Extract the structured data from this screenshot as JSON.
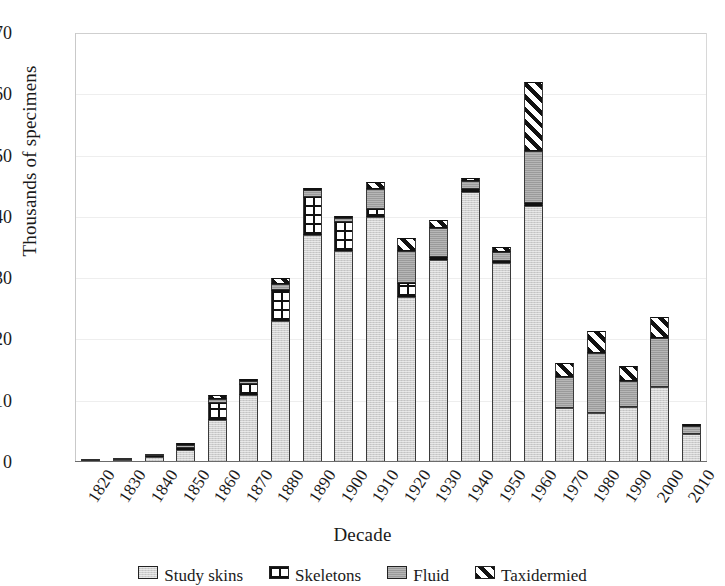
{
  "chart_data": {
    "type": "bar",
    "title": "",
    "subtitle": "",
    "xlabel": "Decade",
    "ylabel": "Thousands of specimens",
    "ylim": [
      0,
      70
    ],
    "yticks": [
      0,
      10,
      20,
      30,
      40,
      50,
      60,
      70
    ],
    "grid": false,
    "stacked": true,
    "legend_position": "bottom",
    "legend_note": "legend row is cropped by the bottom edge of the screenshot",
    "categories": [
      "1820",
      "1830",
      "1840",
      "1850",
      "1860",
      "1870",
      "1880",
      "1890",
      "1900",
      "1910",
      "1920",
      "1930",
      "1940",
      "1950",
      "1960",
      "1970",
      "1980",
      "1990",
      "2000",
      "2010"
    ],
    "series": [
      {
        "name": "Study skins",
        "pattern": "light-gray",
        "values": [
          0.2,
          0.4,
          0.8,
          2.0,
          6.8,
          11.0,
          23.0,
          37.0,
          34.5,
          40.0,
          27.0,
          33.0,
          44.0,
          32.5,
          41.8,
          8.8,
          8.0,
          9.0,
          12.2,
          4.5
        ]
      },
      {
        "name": "Skeletons",
        "pattern": "grid",
        "values": [
          0.0,
          0.0,
          0.1,
          0.3,
          2.8,
          1.8,
          5.0,
          6.3,
          4.6,
          1.3,
          2.2,
          0.4,
          0.6,
          0.3,
          0.5,
          0.0,
          0.0,
          0.0,
          0.0,
          0.0
        ]
      },
      {
        "name": "Fluid-preserved",
        "pattern": "dark-gray",
        "values": [
          0.1,
          0.2,
          0.3,
          0.4,
          0.7,
          0.5,
          1.0,
          1.1,
          0.7,
          3.2,
          5.3,
          4.8,
          1.3,
          1.5,
          8.5,
          5.1,
          9.8,
          4.3,
          8.0,
          1.4
        ]
      },
      {
        "name": "Taxidermied",
        "pattern": "diagonal-hatch",
        "values": [
          0.0,
          0.0,
          0.0,
          0.1,
          0.6,
          0.2,
          1.1,
          0.2,
          0.2,
          1.2,
          2.0,
          1.3,
          0.4,
          0.8,
          11.2,
          2.2,
          3.6,
          2.3,
          3.4,
          0.2
        ]
      }
    ],
    "totals": [
      0.3,
      0.6,
      1.2,
      2.8,
      10.9,
      13.5,
      30.1,
      44.6,
      40.0,
      45.7,
      36.5,
      39.5,
      46.3,
      35.1,
      62.0,
      16.1,
      21.4,
      15.6,
      23.6,
      6.1
    ]
  },
  "legend": {
    "items": [
      {
        "label": "Study skins",
        "pattern": "light-gray"
      },
      {
        "label": "Skeletons",
        "pattern": "grid"
      },
      {
        "label": "Fluid",
        "pattern": "dark-gray"
      },
      {
        "label": "Taxidermied",
        "pattern": "diagonal-hatch"
      }
    ]
  },
  "colors": {
    "light_gray": "#cfcfcf",
    "mid_gray": "#9a9a9a",
    "black": "#111111",
    "white": "#ffffff",
    "axis": "#6b6b6b",
    "frame": "#c9c9c9"
  }
}
